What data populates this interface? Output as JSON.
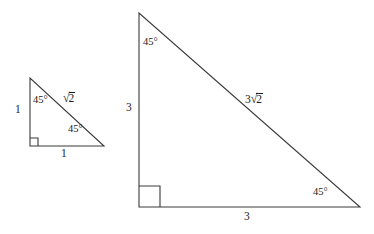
{
  "figure": {
    "background_color": "#ffffff",
    "stroke_color": "#3a3a3a",
    "text_color": "#1c1c1c"
  },
  "small_triangle": {
    "name": "small-right-triangle",
    "vertices": {
      "apex": [
        30,
        78
      ],
      "right_angle": [
        30,
        146
      ],
      "base_right": [
        104,
        146
      ]
    },
    "angle_top_label": "45°",
    "angle_bottom_right_label": "45°",
    "right_angle_label": "90°",
    "leg_vertical_label": "1",
    "leg_horizontal_label": "1",
    "hypotenuse_coefficient": "",
    "hypotenuse_radicand": "2",
    "hypotenuse_label": "√2"
  },
  "large_triangle": {
    "name": "large-right-triangle",
    "vertices": {
      "apex": [
        139,
        13
      ],
      "right_angle": [
        139,
        207
      ],
      "base_right": [
        360,
        207
      ]
    },
    "angle_top_label": "45°",
    "angle_bottom_right_label": "45°",
    "right_angle_label": "90°",
    "leg_vertical_label": "3",
    "leg_horizontal_label": "3",
    "hypotenuse_coefficient": "3",
    "hypotenuse_radicand": "2",
    "hypotenuse_label": "3√2"
  },
  "glyphs": {
    "radical_sign": "√"
  }
}
